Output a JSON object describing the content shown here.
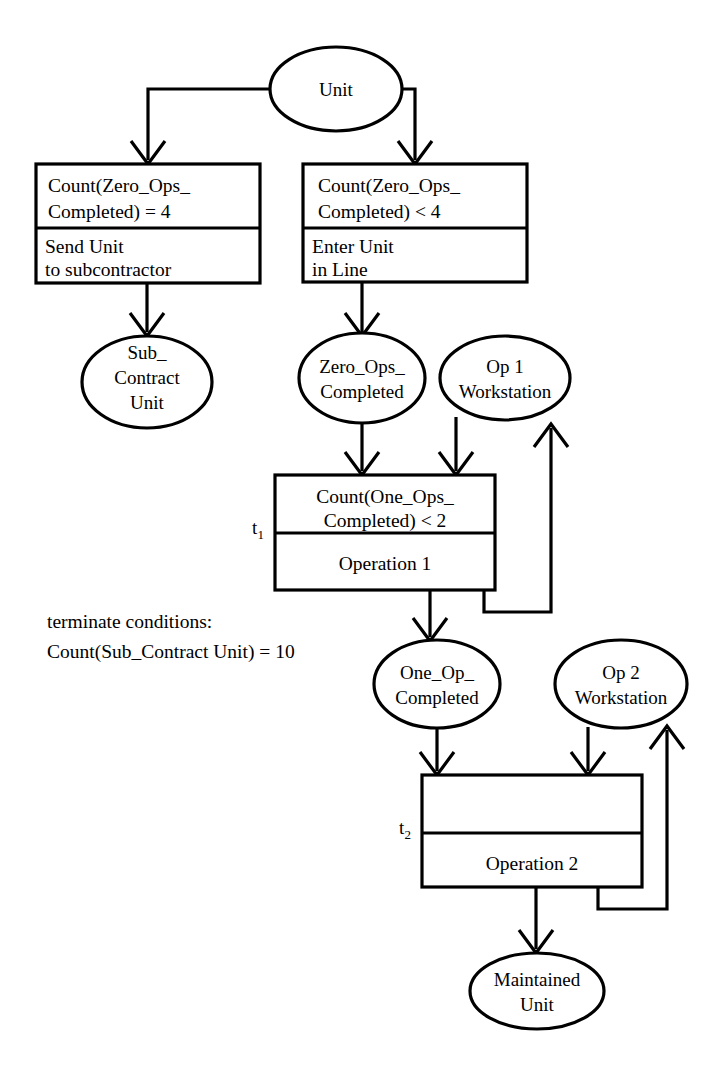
{
  "diagram": {
    "nodes": {
      "unit": {
        "label": "Unit"
      },
      "sub_contract_unit": {
        "line1": "Sub_",
        "line2": "Contract",
        "line3": "Unit"
      },
      "zero_ops_completed": {
        "line1": "Zero_Ops_",
        "line2": "Completed"
      },
      "op1_workstation": {
        "line1": "Op 1",
        "line2": "Workstation"
      },
      "one_op_completed": {
        "line1": "One_Op_",
        "line2": "Completed"
      },
      "op2_workstation": {
        "line1": "Op 2",
        "line2": "Workstation"
      },
      "maintained_unit": {
        "line1": "Maintained",
        "line2": "Unit"
      }
    },
    "transitions": {
      "send_to_subcontractor": {
        "guard_line1": "Count(Zero_Ops_",
        "guard_line2": "Completed) = 4",
        "action_line1": "Send Unit",
        "action_line2": "to subcontractor"
      },
      "enter_line": {
        "guard_line1": "Count(Zero_Ops_",
        "guard_line2": "Completed) < 4",
        "action_line1": "Enter Unit",
        "action_line2": "in Line"
      },
      "t1": {
        "name": "t",
        "subscript": "1",
        "guard_line1": "Count(One_Ops_",
        "guard_line2": "Completed) < 2",
        "action_line1": "Operation 1"
      },
      "t2": {
        "name": "t",
        "subscript": "2",
        "guard_line1": "",
        "guard_line2": "",
        "action_line1": "Operation 2"
      }
    },
    "annotations": {
      "terminate_heading": "terminate conditions:",
      "terminate_condition": "Count(Sub_Contract Unit) = 10"
    },
    "caption": ""
  }
}
